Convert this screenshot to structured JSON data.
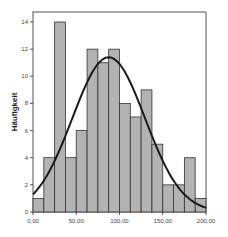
{
  "chart_data": {
    "type": "bar",
    "subtype": "histogram",
    "title": "",
    "xlabel": "",
    "ylabel": "Häufigkeit",
    "bin_width": 12.5,
    "bin_edges": [
      0,
      12.5,
      25,
      37.5,
      50,
      62.5,
      75,
      87.5,
      100,
      112.5,
      125,
      137.5,
      150,
      162.5,
      175,
      187.5,
      200
    ],
    "values": [
      1,
      4,
      14,
      4,
      6,
      12,
      11,
      12,
      8,
      7,
      9,
      5,
      2,
      2,
      4,
      1
    ],
    "xlim": [
      0,
      200
    ],
    "ylim": [
      0,
      15
    ],
    "x_ticks": [
      0,
      50,
      100,
      150,
      200
    ],
    "x_tick_labels": [
      "0,00",
      "50,00",
      "100,00",
      "150,00",
      "200,00"
    ],
    "y_ticks": [
      0,
      2,
      4,
      6,
      8,
      10,
      12,
      14
    ],
    "y_tick_labels": [
      "0",
      "2",
      "4",
      "6",
      "8",
      "10",
      "12",
      "14"
    ],
    "overlay": {
      "type": "normal_curve",
      "mean": 87.5,
      "sd": 42,
      "peak": 11.4
    },
    "grid": false,
    "legend": null,
    "colors": {
      "bar_fill": "#b3b3b3",
      "bar_stroke": "#333333",
      "curve": "#1a1a1a",
      "frame": "#555555"
    }
  }
}
